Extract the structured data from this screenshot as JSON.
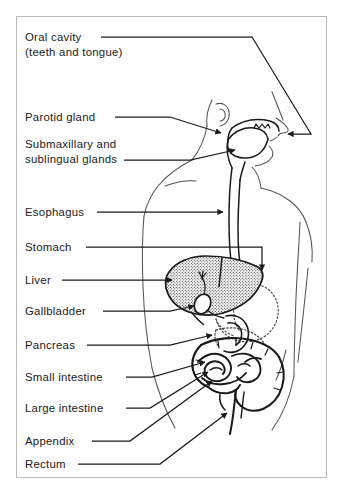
{
  "figure": {
    "background_color": "#ffffff",
    "ink_color": "#1a1a1a",
    "frame_color": "#b9b9b9",
    "body_outline_color": "#4a4a4a"
  },
  "labels": [
    {
      "id": "oral-cavity",
      "line1": "Oral cavity",
      "line2": "(teeth and tongue)",
      "x": 25,
      "y1": 40,
      "y2": 55
    },
    {
      "id": "parotid-gland",
      "line1": "Parotid gland",
      "line2": "",
      "x": 25,
      "y1": 119,
      "y2": 0
    },
    {
      "id": "submaxillary-sublingual-glands",
      "line1": "Submaxillary and",
      "line2": "sublingual glands",
      "x": 25,
      "y1": 145,
      "y2": 160
    },
    {
      "id": "esophagus",
      "line1": "Esophagus",
      "line2": "",
      "x": 25,
      "y1": 215,
      "y2": 0
    },
    {
      "id": "stomach",
      "line1": "Stomach",
      "line2": "",
      "x": 25,
      "y1": 250,
      "y2": 0
    },
    {
      "id": "liver",
      "line1": "Liver",
      "line2": "",
      "x": 25,
      "y1": 283,
      "y2": 0
    },
    {
      "id": "gallbladder",
      "line1": "Gallbladder",
      "line2": "",
      "x": 25,
      "y1": 314,
      "y2": 0
    },
    {
      "id": "pancreas",
      "line1": "Pancreas",
      "line2": "",
      "x": 25,
      "y1": 348,
      "y2": 0
    },
    {
      "id": "small-intestine",
      "line1": "Small intestine",
      "line2": "",
      "x": 25,
      "y1": 380,
      "y2": 0
    },
    {
      "id": "large-intestine",
      "line1": "Large intestine",
      "line2": "",
      "x": 25,
      "y1": 411,
      "y2": 0
    },
    {
      "id": "appendix",
      "line1": "Appendix",
      "line2": "",
      "x": 25,
      "y1": 444,
      "y2": 0
    },
    {
      "id": "rectum",
      "line1": "Rectum",
      "line2": "",
      "x": 25,
      "y1": 467,
      "y2": 0
    }
  ]
}
